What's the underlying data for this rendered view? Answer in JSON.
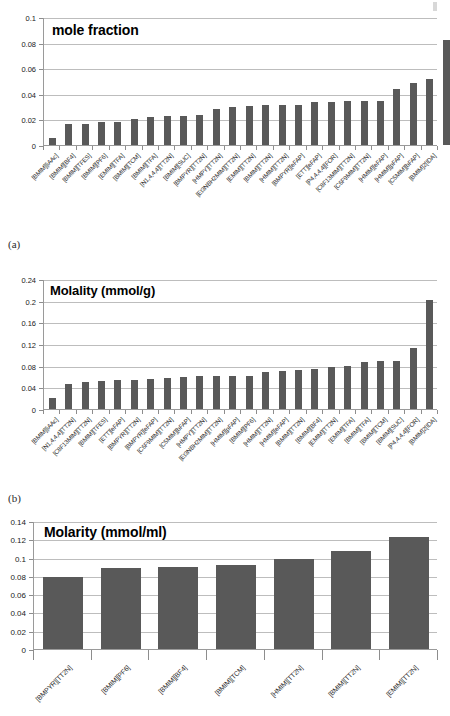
{
  "figure": {
    "panels": [
      {
        "letter": "(a)"
      },
      {
        "letter": "(b)"
      }
    ]
  },
  "chart_data": [
    {
      "id": "a",
      "type": "bar",
      "title": "mole fraction",
      "xlabel": "",
      "ylabel": "",
      "ylim": [
        0,
        0.1
      ],
      "yticks": [
        "0",
        "0.02",
        "0.04",
        "0.06",
        "0.08",
        "0.1"
      ],
      "ytick_values": [
        0,
        0.02,
        0.04,
        0.06,
        0.08,
        0.1
      ],
      "grid": true,
      "legend": "none",
      "bar_color": "#595959",
      "categories": [
        "[BMIM][iAAc]",
        "[BMIM][BF4]",
        "[BMIM][TFES]",
        "[BMIM][PF6]",
        "[EMIM][TFA]",
        "[BMIM][TCM]",
        "[BMIM][TFA]",
        "[N1,4,4,4][TT2N]",
        "[BMIM][SUC]",
        "[BMPYR][TT2N]",
        "[HMPY][TT2N]",
        "[Et3NBH2MIM][TT2N]",
        "[EMIM][TT2N]",
        "[BMIM][TT2N]",
        "[HMIM][TT2N]",
        "[BMPYR][eFAP]",
        "[ETT][eFAP]",
        "[P4,4,4,4][FOR]",
        "[C8F13MIM][TT2N]",
        "[C6F9MIM][TT2N]",
        "[HMIM][eFAP]",
        "[HMIM][pFAP]",
        "[C5MIM][bFAP]",
        "[BMIM]2[IDA]"
      ],
      "values": [
        0.0055,
        0.0168,
        0.0168,
        0.0176,
        0.0177,
        0.0205,
        0.0219,
        0.0225,
        0.023,
        0.0235,
        0.0285,
        0.0297,
        0.0303,
        0.0309,
        0.0312,
        0.0315,
        0.0333,
        0.0334,
        0.0345,
        0.0346,
        0.0347,
        0.044,
        0.0484,
        0.0513,
        0.082
      ]
    },
    {
      "id": "b",
      "type": "bar",
      "title": "Molality (mmol/g)",
      "xlabel": "",
      "ylabel": "",
      "ylim": [
        0,
        0.24
      ],
      "yticks": [
        "0",
        "0.04",
        "0.08",
        "0.12",
        "0.16",
        "0.2",
        "0.24"
      ],
      "ytick_values": [
        0,
        0.04,
        0.08,
        0.12,
        0.16,
        0.2,
        0.24
      ],
      "grid": true,
      "legend": "none",
      "bar_color": "#595959",
      "categories": [
        "[BMIM][iAAc]",
        "[N1,4,4,4][TT2N]",
        "[C8F13MIM][TT2N]",
        "[BMIM][TFES]",
        "[ETT][eFAP]",
        "[BMPYR][TT2N]",
        "[BMPYR][eFAP]",
        "[C6F9MIM][TT2N]",
        "[C5MIM][bFAP]",
        "[HMPY][TT2N]",
        "[Et3NBH2MIM][TT2N]",
        "[HMIM][pFAP]",
        "[BMIM][PF6]",
        "[HMIM][TT2N]",
        "[HMIM][eFAP]",
        "[BMIM][TT2N]",
        "[BMIM][BF4]",
        "[EMIM][TT2N]",
        "[EMIM][TFA]",
        "[BMIM][TFA]",
        "[BMIM][TCM]",
        "[BMIM][SUC]",
        "[P4,4,4,4][FOR]",
        "[BMIM]2[IDA]"
      ],
      "values": [
        0.021,
        0.047,
        0.049,
        0.052,
        0.054,
        0.054,
        0.056,
        0.058,
        0.059,
        0.061,
        0.061,
        0.061,
        0.061,
        0.069,
        0.07,
        0.072,
        0.074,
        0.077,
        0.079,
        0.086,
        0.088,
        0.089,
        0.112,
        0.202
      ]
    },
    {
      "id": "c",
      "type": "bar",
      "title": "Molarity (mmol/ml)",
      "xlabel": "",
      "ylabel": "",
      "ylim": [
        0,
        0.14
      ],
      "yticks": [
        "0",
        "0.02",
        "0.04",
        "0.06",
        "0.08",
        "0.1",
        "0.12",
        "0.14"
      ],
      "ytick_values": [
        0,
        0.02,
        0.04,
        0.06,
        0.08,
        0.1,
        0.12,
        0.14
      ],
      "grid": true,
      "legend": "none",
      "bar_color": "#595959",
      "categories": [
        "[BMPYR][TT2N]",
        "[BMIM][PF6]",
        "[BMIM][BF4]",
        "[BMIM][TCM]",
        "[HMIM][TT2N]",
        "[BMIM][TT2N]",
        "[EMIM][TT2N]"
      ],
      "values": [
        0.079,
        0.089,
        0.09,
        0.092,
        0.098,
        0.107,
        0.122
      ]
    }
  ]
}
